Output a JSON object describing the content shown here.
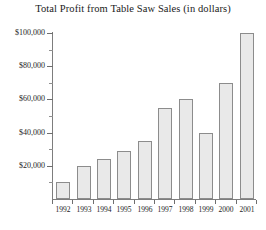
{
  "chart_data": {
    "type": "bar",
    "title": "Total Profit from Table Saw Sales (in dollars)",
    "xlabel": "",
    "ylabel": "",
    "categories": [
      "1992",
      "1993",
      "1994",
      "1995",
      "1996",
      "1997",
      "1998",
      "1999",
      "2000",
      "2001"
    ],
    "values": [
      10000,
      20000,
      24000,
      29000,
      35000,
      55000,
      60000,
      40000,
      70000,
      100000
    ],
    "ylim": [
      0,
      100000
    ],
    "y_major_ticks": [
      20000,
      40000,
      60000,
      80000,
      100000
    ],
    "y_tick_labels": [
      "$20,000",
      "$40,000",
      "$60,000",
      "$80,000",
      "$100,000"
    ],
    "y_minor_tick_interval": 10000,
    "grid": false,
    "legend": null,
    "legend_position": "none",
    "bar_fill_color": "#e9e9e9",
    "bar_border_color": "#8c8c8c",
    "axis_color": "#7d7d7d",
    "text_color": "#1d1d1d",
    "background_color": "#ffffff"
  }
}
